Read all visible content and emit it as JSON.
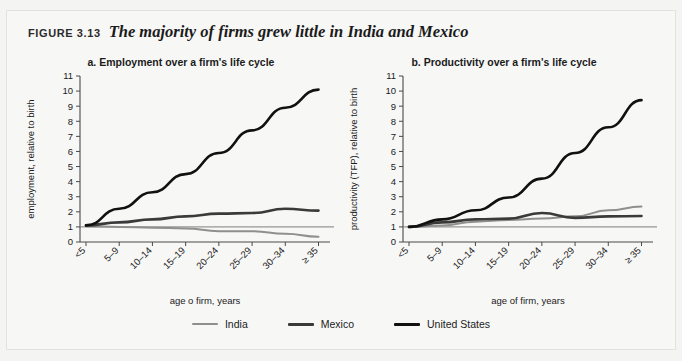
{
  "figure": {
    "label": "FIGURE 3.13",
    "title": "The majority of firms grew little in India and Mexico"
  },
  "colors": {
    "india": "#8f8f8f",
    "mexico": "#3a3a3a",
    "united_states": "#111111",
    "axis": "#4a4a4a",
    "baseline": "#6f6f6f",
    "panel_background": "#f7f7f6",
    "frame_border": "#e2e2e0"
  },
  "legend": {
    "position": "bottom-center",
    "items": [
      {
        "label": "India",
        "color": "#8f8f8f",
        "weight": "thin"
      },
      {
        "label": "Mexico",
        "color": "#3a3a3a",
        "weight": "thick"
      },
      {
        "label": "United States",
        "color": "#111111",
        "weight": "thick"
      }
    ]
  },
  "chart_data": [
    {
      "type": "line",
      "panel": "a",
      "title": "a.  Employment over a firm's life cycle",
      "xlabel": "age o firm, years",
      "ylabel": "employment, relative to birth",
      "categories": [
        "<5",
        "5–9",
        "10–14",
        "15–19",
        "20–24",
        "25–29",
        "30–34",
        "≥ 35"
      ],
      "ylim": [
        0,
        11
      ],
      "yticks": [
        0,
        1,
        2,
        3,
        4,
        5,
        6,
        7,
        8,
        9,
        10,
        11
      ],
      "grid": false,
      "reference_line": 1,
      "series": [
        {
          "name": "India",
          "color": "#8f8f8f",
          "values": [
            1.05,
            1.0,
            0.95,
            0.9,
            0.72,
            0.72,
            0.55,
            0.35
          ]
        },
        {
          "name": "Mexico",
          "color": "#3a3a3a",
          "values": [
            1.1,
            1.3,
            1.5,
            1.7,
            1.88,
            1.92,
            2.2,
            2.08
          ]
        },
        {
          "name": "United States",
          "color": "#111111",
          "values": [
            1.1,
            2.2,
            3.3,
            4.5,
            5.9,
            7.4,
            8.9,
            10.1
          ]
        }
      ]
    },
    {
      "type": "line",
      "panel": "b",
      "title": "b.  Productivity over a firm's life cycle",
      "xlabel": "age of firm, years",
      "ylabel": "productivity (TFP), relative to birth",
      "categories": [
        "<5",
        "5–9",
        "10–14",
        "15–19",
        "20–24",
        "25–29",
        "30–34",
        "≥ 35"
      ],
      "ylim": [
        0,
        11
      ],
      "yticks": [
        0,
        1,
        2,
        3,
        4,
        5,
        6,
        7,
        8,
        9,
        10,
        11
      ],
      "grid": false,
      "reference_line": 1,
      "series": [
        {
          "name": "India",
          "color": "#8f8f8f",
          "values": [
            1.0,
            1.1,
            1.35,
            1.45,
            1.55,
            1.7,
            2.1,
            2.35
          ]
        },
        {
          "name": "Mexico",
          "color": "#3a3a3a",
          "values": [
            1.0,
            1.3,
            1.5,
            1.55,
            1.92,
            1.6,
            1.7,
            1.72
          ]
        },
        {
          "name": "United States",
          "color": "#111111",
          "values": [
            1.0,
            1.5,
            2.1,
            2.95,
            4.2,
            5.9,
            7.6,
            9.4
          ]
        }
      ]
    }
  ]
}
